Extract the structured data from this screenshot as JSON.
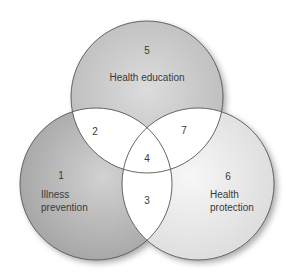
{
  "diagram": {
    "type": "venn",
    "sets": [
      {
        "id": "health_education",
        "label": "Health education",
        "region_number": "5",
        "fill": "#c6c6c6"
      },
      {
        "id": "illness_prevention",
        "label_lines": [
          "Illness",
          "prevention"
        ],
        "region_number": "1",
        "fill": "#b4b4b4"
      },
      {
        "id": "health_protection",
        "label_lines": [
          "Health",
          "protection"
        ],
        "region_number": "6",
        "fill": "#e6e6e6"
      }
    ],
    "intersections": [
      {
        "sets": [
          "health_education",
          "illness_prevention"
        ],
        "region_number": "2"
      },
      {
        "sets": [
          "health_education",
          "health_protection"
        ],
        "region_number": "7"
      },
      {
        "sets": [
          "illness_prevention",
          "health_protection"
        ],
        "region_number": "3"
      },
      {
        "sets": [
          "health_education",
          "illness_prevention",
          "health_protection"
        ],
        "region_number": "4"
      }
    ],
    "colors": {
      "outline": "#555555",
      "overlap_fill": "#ffffff",
      "text": "#3a3a3a"
    }
  },
  "labels": {
    "region1": "1",
    "region2": "2",
    "region3": "3",
    "region4": "4",
    "region5": "5",
    "region6": "6",
    "region7": "7",
    "health_education": "Health education",
    "illness": "Illness",
    "prevention": "prevention",
    "health": "Health",
    "protection": "protection"
  }
}
